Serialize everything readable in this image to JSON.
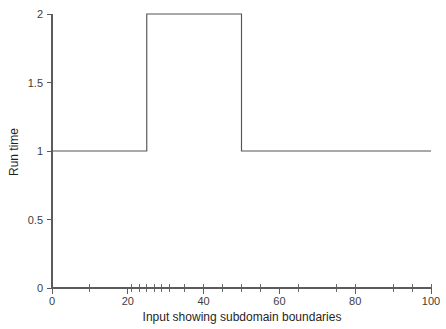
{
  "chart_data": {
    "type": "line",
    "title": "",
    "subtitle": "",
    "xlabel": "Input showing subdomain boundaries",
    "ylabel": "Run time",
    "xlim": [
      0,
      100
    ],
    "ylim": [
      0,
      2
    ],
    "grid": false,
    "legend": null,
    "line_style": "step-post",
    "x": [
      0,
      25,
      25,
      50,
      50,
      100
    ],
    "y": [
      1,
      1,
      2,
      2,
      1,
      1
    ],
    "series": [
      {
        "name": "Run time",
        "x": [
          0,
          25,
          25,
          50,
          50,
          100
        ],
        "values": [
          1,
          1,
          2,
          2,
          1,
          1
        ],
        "color": "#555555"
      }
    ],
    "x_ticks_labeled": [
      0,
      20,
      40,
      60,
      80,
      100
    ],
    "x_tick_labels": [
      "0",
      "20",
      "40",
      "60",
      "80",
      "100"
    ],
    "y_ticks_labeled": [
      0,
      0.5,
      1,
      1.5,
      2
    ],
    "y_tick_labels": [
      "0",
      "0.5",
      "1",
      "1.5",
      "2"
    ],
    "subdomain_boundary_ticks": [
      0,
      10,
      21,
      23,
      25,
      27,
      29,
      31,
      35,
      40,
      45,
      50,
      55,
      65,
      75,
      80,
      90,
      95,
      100
    ],
    "annotations": []
  },
  "axes": {
    "y_axis_title": "Run time",
    "x_axis_title": "Input showing subdomain boundaries"
  },
  "style": {
    "background": "#ffffff",
    "axis_color": "#5b5b5b",
    "line_color": "#555555",
    "text_color": "#1f1f1f"
  }
}
